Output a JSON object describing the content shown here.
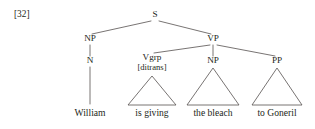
{
  "figure": {
    "example_number": "[32]",
    "kind": "syntax-tree",
    "sentence": "William is giving the bleach to Goneril",
    "ink_color": "#231f20",
    "line_color": "#55504f",
    "background_color": "#ffffff"
  },
  "tree": {
    "root": {
      "id": "s",
      "label": "S",
      "x": 155,
      "y": 16
    },
    "nodes": [
      {
        "id": "np-subject",
        "label": "NP",
        "x": 90,
        "y": 40
      },
      {
        "id": "n-head",
        "label": "N",
        "x": 90,
        "y": 62
      },
      {
        "id": "vp",
        "label": "VP",
        "x": 213,
        "y": 40
      },
      {
        "id": "vgrp",
        "label": "Vgrp",
        "feature": "[ditrans]",
        "x": 152,
        "y": 59
      },
      {
        "id": "np-object",
        "label": "NP",
        "x": 213,
        "y": 62
      },
      {
        "id": "pp",
        "label": "PP",
        "x": 277,
        "y": 62
      }
    ],
    "leaves": [
      {
        "id": "leaf-william",
        "label": "William",
        "x": 90,
        "y": 112,
        "parent": "n-head",
        "triangle": false
      },
      {
        "id": "leaf-is-giving",
        "label": "is giving",
        "x": 152,
        "y": 112,
        "parent": "vgrp",
        "triangle": true
      },
      {
        "id": "leaf-the-bleach",
        "label": "the bleach",
        "x": 213,
        "y": 112,
        "parent": "np-object",
        "triangle": true
      },
      {
        "id": "leaf-to-goneril",
        "label": "to Goneril",
        "x": 277,
        "y": 112,
        "parent": "pp",
        "triangle": true
      }
    ]
  }
}
